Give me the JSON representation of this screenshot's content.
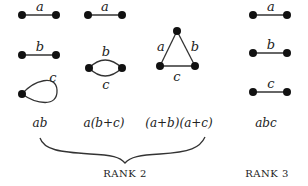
{
  "columns": [
    {
      "graphs": [
        {
          "type": "edge",
          "label": "a"
        },
        {
          "type": "edge",
          "label": "b"
        },
        {
          "type": "loop",
          "label": "c"
        }
      ],
      "expression": "ab"
    },
    {
      "graphs": [
        {
          "type": "edge",
          "label": "a"
        },
        {
          "type": "parallel-edges",
          "labels": [
            "b",
            "c"
          ]
        }
      ],
      "expression": "a(b+c)"
    },
    {
      "graphs": [
        {
          "type": "triangle",
          "labels": [
            "a",
            "b",
            "c"
          ]
        }
      ],
      "expression": "(a+b)(a+c)"
    },
    {
      "graphs": [
        {
          "type": "edge",
          "label": "a"
        },
        {
          "type": "edge",
          "label": "b"
        },
        {
          "type": "edge",
          "label": "c"
        }
      ],
      "expression": "abc"
    }
  ],
  "groups": [
    {
      "label": "RANK 2",
      "spans_columns": [
        0,
        1,
        2
      ],
      "bracket": "curly-brace"
    },
    {
      "label": "RANK 3",
      "spans_columns": [
        3
      ]
    }
  ]
}
